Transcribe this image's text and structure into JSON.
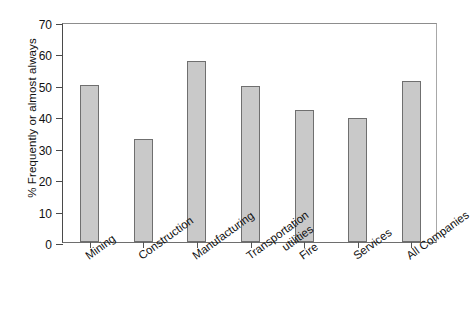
{
  "chart_data": {
    "type": "bar",
    "title": "",
    "subtitle": "",
    "xlabel": "",
    "ylabel": "% Frequently or almost always",
    "ylim": [
      0,
      70
    ],
    "yticks": [
      0,
      10,
      20,
      30,
      40,
      50,
      60,
      70
    ],
    "ytick_labels": [
      "0",
      "10",
      "20",
      "30",
      "40",
      "50",
      "60",
      "70"
    ],
    "grid": false,
    "legend": null,
    "bar_color": "#c9c9c9",
    "bar_edge_color": "#6f6f6f",
    "axis_color": "#4a4a4a",
    "categories": [
      "Mining",
      "Construction",
      "Manufacturing",
      "Transportation utilities",
      "Fire",
      "Services",
      "All Companies"
    ],
    "category_lines": [
      [
        "Mining"
      ],
      [
        "Construction"
      ],
      [
        "Manufacturing"
      ],
      [
        "Transportation",
        "utilities"
      ],
      [
        "Fire"
      ],
      [
        "Services"
      ],
      [
        "All Companies"
      ]
    ],
    "values": [
      50.0,
      32.9,
      57.5,
      49.7,
      42.1,
      39.6,
      51.3
    ]
  }
}
